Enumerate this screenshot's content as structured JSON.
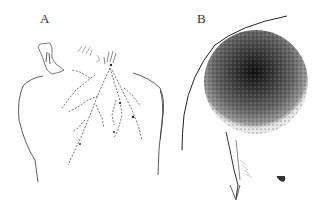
{
  "figure": {
    "panels": [
      {
        "label": "A",
        "description": "Back view of upper torso with branching linear lesions from neck region"
      },
      {
        "label": "B",
        "description": "Shoulder and chest with large dark stippled circular lesion"
      }
    ]
  },
  "colors": {
    "ink": "#222222",
    "lesion_dark": "#1a1a1a",
    "lesion_mid": "#555555",
    "lesion_light": "#9a9a9a"
  }
}
